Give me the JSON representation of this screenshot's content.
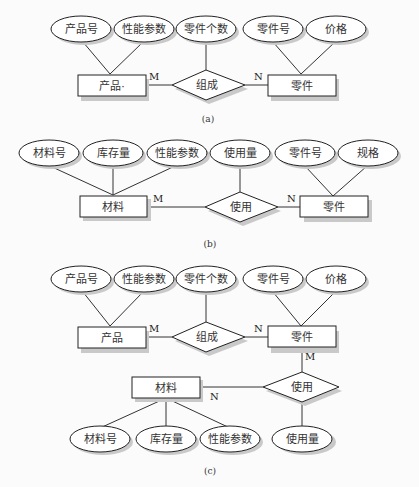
{
  "diagrams": {
    "a": {
      "caption": "(a)",
      "entities": {
        "product": "产品·",
        "part": "零件"
      },
      "relationship": "组成",
      "attributes": {
        "product_no": "产品号",
        "perf_params": "性能参数",
        "part_count": "零件个数",
        "part_no": "零件号",
        "price": "价格"
      },
      "cardinality": {
        "left": "M",
        "right": "N"
      }
    },
    "b": {
      "caption": "(b)",
      "entities": {
        "material": "材料",
        "part": "零件"
      },
      "relationship": "使用",
      "attributes": {
        "material_no": "材料号",
        "stock": "库存量",
        "perf_params": "性能参数",
        "usage": "使用量",
        "part_no": "零件号",
        "spec": "规格"
      },
      "cardinality": {
        "left": "M",
        "right": "N"
      }
    },
    "c": {
      "caption": "(c)",
      "entities": {
        "product": "产品",
        "part": "零件",
        "material": "材料"
      },
      "relationships": {
        "compose": "组成",
        "use": "使用"
      },
      "attributes": {
        "product_no": "产品号",
        "perf_params": "性能参数",
        "part_count": "零件个数",
        "part_no": "零件号",
        "price": "价格",
        "material_no": "材料号",
        "stock": "库存量",
        "material_perf_params": "性能参数",
        "usage": "使用量"
      },
      "cardinality": {
        "compose_left": "M",
        "compose_right": "N",
        "use_part": "M",
        "use_material": "N"
      }
    }
  }
}
